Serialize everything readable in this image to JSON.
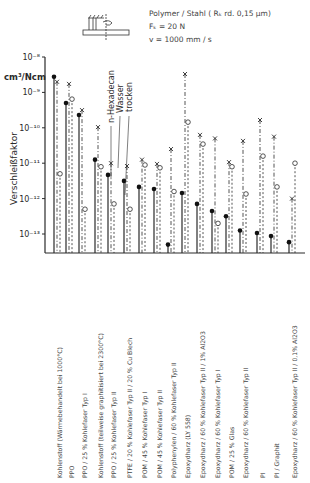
{
  "chart_data": {
    "type": "scatter",
    "conditions": [
      "Polymer / Stahl ( Rₖ rd. 0,15 µm)",
      "Fₖ = 20 N",
      "v = 1000 mm / s"
    ],
    "ylabel": "Verschleißfaktor",
    "yunit": "cm³/Ncm",
    "yscale": "log",
    "ylim": [
      1e-13,
      1e-08
    ],
    "yticks": [
      "10⁻⁸",
      "10⁻⁹",
      "10⁻¹⁰",
      "10⁻¹¹",
      "10⁻¹²",
      "10⁻¹³"
    ],
    "ytick_exponents": [
      -8,
      -9,
      -10,
      -11,
      -12,
      -13
    ],
    "legend": [
      "n-Hexadecan",
      "Wasser",
      "trocken"
    ],
    "categories": [
      "Kohlenstoff (Wärmebehandelt bei 1000°C)",
      "PPO",
      "PPO / 25 % Kohlefaser Typ I",
      "Kohlenstoff (teilweise graphitisiert bei 2300°C)",
      "PPO / 25 % Kohlefaser Typ II",
      "PTFE / 20 % Kohlefaser Typ II / 20 % Cu Blech",
      "POM / 45 % Kohlefaser Typ I",
      "POM / 45 % Kohlefaser Typ II",
      "Polyphenylen / 60 % Kohlefaser Typ II",
      "Epoxydharz (LY 558)",
      "Epoxydharz / 60 % Kohlefaser Typ II / 1% Al2O3",
      "Epoxydharz / 60 % Kohlefaser Typ I",
      "POM / 25 % Glas",
      "Epoxydharz / 60 % Kohlefaser Typ II",
      "PI",
      "PI / Graphit",
      "Epoxydharz / 60 % Kohlefaser Typ II / 0,1% Al2O3"
    ],
    "series": [
      {
        "name": "trocken",
        "marker": "filled-circle",
        "line": "solid",
        "log10_values": [
          -8.56,
          -9.3,
          -9.64,
          -10.9,
          -11.33,
          -11.5,
          -11.67,
          -11.73,
          -13.3,
          -11.84,
          -12.15,
          -12.35,
          -12.5,
          -12.9,
          -12.97,
          -13.06,
          -13.23
        ]
      },
      {
        "name": "Wasser",
        "marker": "x",
        "line": "dash-dot",
        "log10_values": [
          -8.7,
          -8.76,
          -9.5,
          -9.98,
          -11.0,
          -11.08,
          -10.9,
          -11.02,
          -10.6,
          -8.48,
          -10.2,
          -10.3,
          -10.97,
          -10.37,
          -9.78,
          -10.25,
          -12.0
        ]
      },
      {
        "name": "n-Hexadecan",
        "marker": "open-circle",
        "line": "dashed",
        "log10_values": [
          -11.3,
          -9.19,
          -12.3,
          -11.1,
          -12.15,
          -12.3,
          -11.05,
          -11.13,
          -11.8,
          -9.84,
          -10.46,
          -12.7,
          -11.1,
          -11.87,
          -10.8,
          -11.67,
          -11.0
        ]
      }
    ],
    "grid": false,
    "legend_position": "annotations near columns 4-6"
  },
  "layout": {
    "axis_x": 45,
    "axis_right": 305,
    "baseline_y": 253,
    "top_y": 57,
    "px_per_decade": 35.4,
    "label_x": [
      60,
      72,
      85,
      101,
      114,
      130,
      145,
      160,
      174,
      188,
      203,
      218,
      232,
      246,
      263,
      277,
      295
    ],
    "label_base_y": 478,
    "ink": "#2a2a2a"
  }
}
